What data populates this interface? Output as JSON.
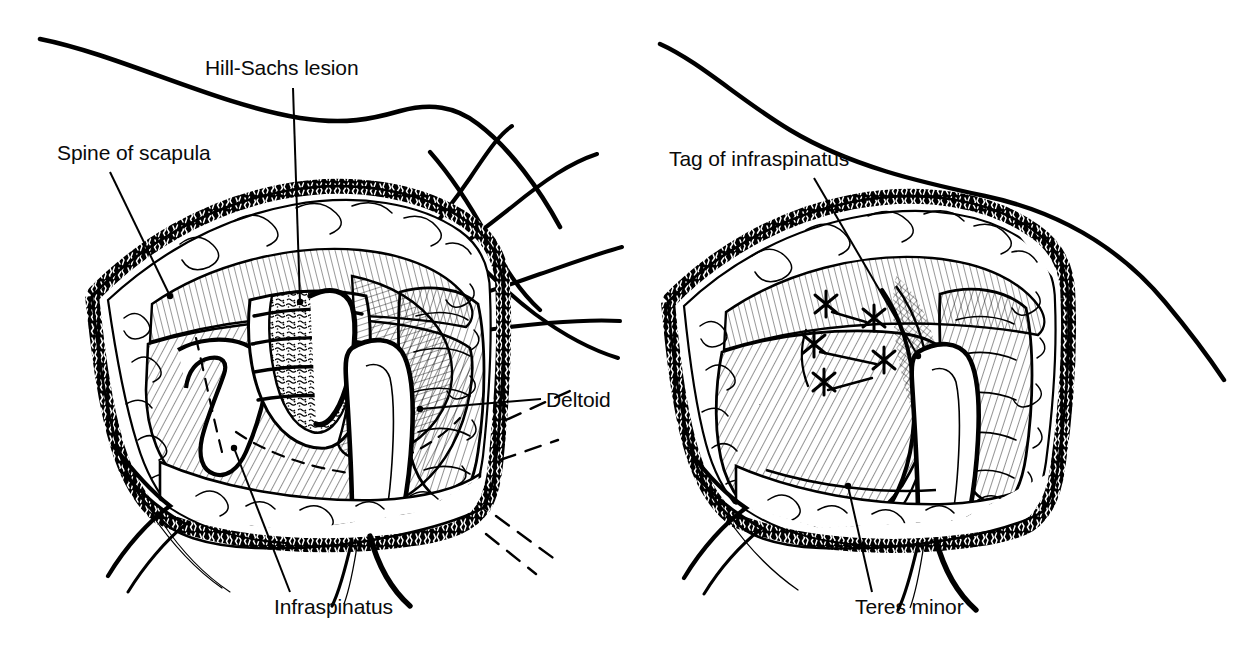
{
  "figure": {
    "kind": "surgical-line-illustration",
    "background_color": "#ffffff",
    "ink_color": "#000000",
    "panel_count": 2
  },
  "panels": [
    {
      "id": "left",
      "name": "posterior-approach-exposure",
      "labels": [
        {
          "key": "hill_sachs",
          "text": "Hill-Sachs lesion"
        },
        {
          "key": "spine",
          "text": "Spine of scapula"
        },
        {
          "key": "deltoid",
          "text": "Deltoid"
        },
        {
          "key": "infraspinatus",
          "text": "Infraspinatus"
        }
      ]
    },
    {
      "id": "right",
      "name": "repair-with-sutures",
      "labels": [
        {
          "key": "tag",
          "text": "Tag of infraspinatus"
        },
        {
          "key": "teres_minor",
          "text": "Teres minor"
        }
      ]
    }
  ],
  "labels": {
    "hill_sachs": "Hill-Sachs lesion",
    "spine_of_scapula": "Spine of scapula",
    "deltoid": "Deltoid",
    "infraspinatus": "Infraspinatus",
    "tag_of_infraspinatus": "Tag of infraspinatus",
    "teres_minor": "Teres minor"
  }
}
